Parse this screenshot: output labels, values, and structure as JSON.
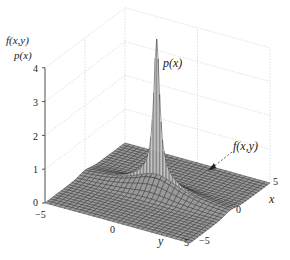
{
  "chart_data": {
    "type": "surface3d",
    "title": "",
    "z_axis_labels": [
      "f(x,y)",
      "p(x)"
    ],
    "xlabel": "x",
    "ylabel": "y",
    "zlabel": "f(x,y) / p(x)",
    "x_range": [
      -5,
      5
    ],
    "y_range": [
      -5,
      5
    ],
    "z_range": [
      0,
      4
    ],
    "x_ticks": [
      -5,
      0,
      5
    ],
    "y_ticks": [
      -5,
      0,
      5
    ],
    "z_ticks": [
      0,
      1,
      2,
      3,
      4
    ],
    "grid": true,
    "annotations": [
      {
        "text": "p(x)",
        "target": "peak of marginal density curve at x=0, height ~4"
      },
      {
        "text": "f(x,y)",
        "target": "joint density surface (arrow)"
      }
    ],
    "surface": {
      "description": "Joint density f(x,y) shown as a gray mesh over [-5,5]x[-5,5], with the marginal p(x) drawn as a sharp white peak along the x=0 plane reaching ~4",
      "peak_height": 4,
      "mesh_resolution": 30
    },
    "colors": {
      "mesh_fill": "#9a9a9a",
      "mesh_line": "#2a2a2a",
      "peak_fill": "#ffffff",
      "grid": "#d6d6d6",
      "axis": "#555555"
    }
  },
  "labels": {
    "z_label_1": "f(x,y)",
    "z_label_2": "p(x)",
    "peak_annotation": "p(x)",
    "surface_annotation": "f(x,y)",
    "x_axis_name": "x",
    "y_axis_name": "y",
    "z_tick_0": "0",
    "z_tick_1": "1",
    "z_tick_2": "2",
    "z_tick_3": "3",
    "z_tick_4": "4",
    "y_tick_neg5": "−5",
    "y_tick_0": "0",
    "y_tick_5": "5",
    "x_tick_neg5": "−5",
    "x_tick_0": "0",
    "x_tick_5": "5"
  }
}
